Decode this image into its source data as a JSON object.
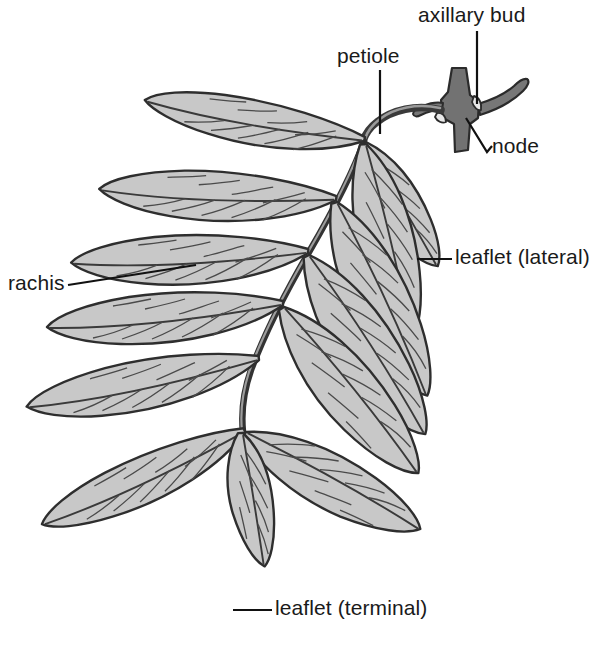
{
  "figure": {
    "background_color": "#ffffff",
    "ink_color": "#1a1a1a",
    "blade_fill_color": "#c8c8c8",
    "blade_edge_color": "#2b2b2b",
    "stem_fill_color": "#6e6e6e",
    "twig_fill_color": "#777777"
  },
  "labels": {
    "axillary_bud": "axillary bud",
    "petiole": "petiole",
    "node": "node",
    "leaflet_lateral": "leaflet (lateral)",
    "rachis": "rachis",
    "leaflet_terminal": "leaflet (terminal)"
  }
}
